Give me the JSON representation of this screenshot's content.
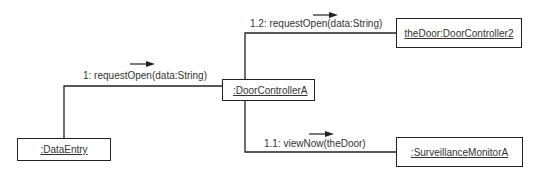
{
  "diagram": {
    "type": "UML collaboration diagram",
    "objects": [
      {
        "id": "dataentry",
        "label": ":DataEntry"
      },
      {
        "id": "doorcontroller",
        "label": ":DoorControllerA"
      },
      {
        "id": "thedoor",
        "label": "theDoor:DoorController2"
      },
      {
        "id": "surveillance",
        "label": ":SurveillanceMonitorA"
      }
    ],
    "messages": [
      {
        "id": "m1",
        "label": "1: requestOpen(data:String)",
        "from": "dataentry",
        "to": "doorcontroller",
        "direction": "right"
      },
      {
        "id": "m12",
        "label": "1.2: requestOpen(data:String)",
        "from": "doorcontroller",
        "to": "thedoor",
        "direction": "right"
      },
      {
        "id": "m11",
        "label": "1.1: viewNow(theDoor)",
        "from": "doorcontroller",
        "to": "surveillance",
        "direction": "right"
      }
    ],
    "colors": {
      "line": "#222222",
      "text": "#333333",
      "background": "#ffffff"
    }
  }
}
